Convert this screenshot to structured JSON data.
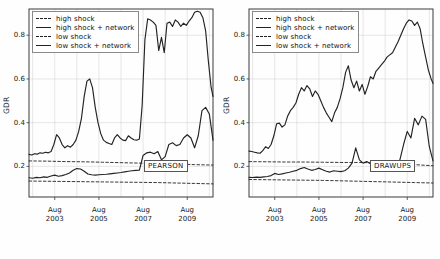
{
  "figure": {
    "panels": [
      "left",
      "right"
    ],
    "background": "#ffffff"
  },
  "legend": {
    "position": "upper-left",
    "entries": [
      {
        "label": "high shock",
        "style": "dashed",
        "color": "#222222"
      },
      {
        "label": "high shock + network",
        "style": "solid",
        "color": "#222222"
      },
      {
        "label": "low shock",
        "style": "dashed",
        "color": "#222222"
      },
      {
        "label": "low shock + network",
        "style": "solid",
        "color": "#222222"
      }
    ]
  },
  "chart_data": [
    {
      "type": "line",
      "panel": "left",
      "title": "",
      "annotation": "PEARSON",
      "xlabel": "",
      "ylabel": "GDR",
      "ylim": [
        0.06,
        0.92
      ],
      "yticks": [
        0.2,
        0.4,
        0.6,
        0.8
      ],
      "ytick_labels": [
        "0.2",
        "0.4",
        "0.6",
        "0.8"
      ],
      "xlim": [
        0,
        100
      ],
      "xticks": [
        14,
        38,
        62,
        86
      ],
      "xtick_labels": [
        [
          "Aug",
          "2003"
        ],
        [
          "Aug",
          "2005"
        ],
        [
          "Aug",
          "2007"
        ],
        [
          "Aug",
          "2009"
        ]
      ],
      "grid": true,
      "legend_position": "upper left",
      "series": [
        {
          "name": "high shock",
          "style": "dashed",
          "x": [
            0,
            10,
            20,
            30,
            40,
            50,
            60,
            70,
            80,
            90,
            100
          ],
          "values": [
            0.225,
            0.224,
            0.222,
            0.221,
            0.219,
            0.217,
            0.215,
            0.213,
            0.211,
            0.208,
            0.206
          ]
        },
        {
          "name": "low shock",
          "style": "dashed",
          "x": [
            0,
            10,
            20,
            30,
            40,
            50,
            60,
            70,
            80,
            90,
            100
          ],
          "values": [
            0.133,
            0.132,
            0.131,
            0.13,
            0.129,
            0.128,
            0.127,
            0.126,
            0.124,
            0.122,
            0.12
          ]
        },
        {
          "name": "high shock + network",
          "style": "solid",
          "x": [
            0,
            1.5,
            3,
            4.5,
            6,
            7.5,
            9,
            10.5,
            12,
            13.5,
            15,
            16.5,
            18,
            19.5,
            21,
            22.5,
            24,
            25.5,
            27,
            28.5,
            30,
            31.5,
            33,
            34.5,
            36,
            37.5,
            39,
            40.5,
            42,
            43.5,
            45,
            46.5,
            48,
            49.5,
            51,
            52.5,
            54,
            55.5,
            57,
            58.5,
            60,
            61.5,
            63,
            64.5,
            66,
            67.5,
            69,
            70.5,
            72,
            73.5,
            75,
            76.5,
            78,
            79.5,
            81,
            82.5,
            84,
            85.5,
            87,
            88.5,
            90,
            91.5,
            93,
            94.5,
            96,
            97.5,
            99,
            100
          ],
          "values": [
            0.255,
            0.252,
            0.258,
            0.256,
            0.262,
            0.26,
            0.265,
            0.262,
            0.268,
            0.3,
            0.345,
            0.33,
            0.3,
            0.285,
            0.295,
            0.288,
            0.3,
            0.32,
            0.36,
            0.42,
            0.52,
            0.59,
            0.6,
            0.56,
            0.47,
            0.4,
            0.35,
            0.32,
            0.31,
            0.305,
            0.3,
            0.33,
            0.345,
            0.33,
            0.32,
            0.318,
            0.34,
            0.33,
            0.322,
            0.32,
            0.325,
            0.48,
            0.78,
            0.875,
            0.87,
            0.86,
            0.845,
            0.73,
            0.79,
            0.72,
            0.855,
            0.86,
            0.84,
            0.87,
            0.86,
            0.84,
            0.855,
            0.845,
            0.865,
            0.88,
            0.905,
            0.91,
            0.905,
            0.88,
            0.82,
            0.68,
            0.56,
            0.52
          ]
        },
        {
          "name": "low shock + network",
          "style": "solid",
          "x": [
            0,
            2,
            4,
            6,
            8,
            10,
            12,
            14,
            16,
            18,
            20,
            22,
            24,
            26,
            28,
            30,
            32,
            34,
            36,
            38,
            40,
            42,
            44,
            46,
            48,
            50,
            52,
            54,
            56,
            58,
            60,
            62,
            64,
            66,
            68,
            70,
            72,
            74,
            76,
            78,
            80,
            82,
            84,
            86,
            88,
            90,
            92,
            94,
            96,
            98,
            100
          ],
          "values": [
            0.148,
            0.146,
            0.15,
            0.148,
            0.152,
            0.15,
            0.156,
            0.16,
            0.155,
            0.158,
            0.163,
            0.17,
            0.182,
            0.19,
            0.188,
            0.178,
            0.165,
            0.162,
            0.16,
            0.162,
            0.163,
            0.164,
            0.166,
            0.168,
            0.17,
            0.172,
            0.175,
            0.178,
            0.18,
            0.182,
            0.183,
            0.25,
            0.262,
            0.265,
            0.258,
            0.268,
            0.23,
            0.245,
            0.3,
            0.308,
            0.295,
            0.3,
            0.33,
            0.345,
            0.33,
            0.285,
            0.34,
            0.455,
            0.47,
            0.44,
            0.32
          ]
        }
      ]
    },
    {
      "type": "line",
      "panel": "right",
      "title": "",
      "annotation": "DRAWUPS",
      "xlabel": "",
      "ylabel": "GDR",
      "ylim": [
        0.06,
        0.92
      ],
      "yticks": [
        0.2,
        0.4,
        0.6,
        0.8
      ],
      "ytick_labels": [
        "0.2",
        "0.4",
        "0.6",
        "0.8"
      ],
      "xlim": [
        0,
        100
      ],
      "xticks": [
        14,
        38,
        62,
        86
      ],
      "xtick_labels": [
        [
          "Aug",
          "2003"
        ],
        [
          "Aug",
          "2005"
        ],
        [
          "Aug",
          "2007"
        ],
        [
          "Aug",
          "2009"
        ]
      ],
      "grid": true,
      "legend_position": "upper left",
      "series": [
        {
          "name": "high shock",
          "style": "dashed",
          "x": [
            0,
            10,
            20,
            30,
            40,
            50,
            60,
            70,
            80,
            90,
            100
          ],
          "values": [
            0.222,
            0.221,
            0.22,
            0.22,
            0.219,
            0.218,
            0.218,
            0.216,
            0.213,
            0.208,
            0.203
          ]
        },
        {
          "name": "low shock",
          "style": "dashed",
          "x": [
            0,
            10,
            20,
            30,
            40,
            50,
            60,
            70,
            80,
            90,
            100
          ],
          "values": [
            0.14,
            0.139,
            0.138,
            0.137,
            0.136,
            0.134,
            0.132,
            0.13,
            0.128,
            0.126,
            0.124
          ]
        },
        {
          "name": "high shock + network",
          "style": "solid",
          "x": [
            0,
            1.5,
            3,
            4.5,
            6,
            7.5,
            9,
            10.5,
            12,
            13.5,
            15,
            16.5,
            18,
            19.5,
            21,
            22.5,
            24,
            25.5,
            27,
            28.5,
            30,
            31.5,
            33,
            34.5,
            36,
            37.5,
            39,
            40.5,
            42,
            43.5,
            45,
            46.5,
            48,
            49.5,
            51,
            52.5,
            54,
            55.5,
            57,
            58.5,
            60,
            61.5,
            63,
            64.5,
            66,
            67.5,
            69,
            70.5,
            72,
            73.5,
            75,
            76.5,
            78,
            79.5,
            81,
            82.5,
            84,
            85.5,
            87,
            88.5,
            90,
            91.5,
            93,
            94.5,
            96,
            97.5,
            99,
            100
          ],
          "values": [
            0.27,
            0.268,
            0.265,
            0.262,
            0.26,
            0.272,
            0.29,
            0.282,
            0.3,
            0.34,
            0.395,
            0.398,
            0.38,
            0.39,
            0.43,
            0.455,
            0.47,
            0.49,
            0.53,
            0.56,
            0.545,
            0.57,
            0.555,
            0.52,
            0.545,
            0.53,
            0.5,
            0.47,
            0.445,
            0.425,
            0.405,
            0.445,
            0.47,
            0.51,
            0.56,
            0.63,
            0.66,
            0.595,
            0.56,
            0.59,
            0.545,
            0.575,
            0.53,
            0.565,
            0.61,
            0.6,
            0.635,
            0.65,
            0.665,
            0.68,
            0.7,
            0.71,
            0.72,
            0.745,
            0.77,
            0.8,
            0.83,
            0.855,
            0.87,
            0.865,
            0.845,
            0.86,
            0.83,
            0.76,
            0.7,
            0.64,
            0.6,
            0.58
          ]
        },
        {
          "name": "low shock + network",
          "style": "solid",
          "x": [
            0,
            2,
            4,
            6,
            8,
            10,
            12,
            14,
            16,
            18,
            20,
            22,
            24,
            26,
            28,
            30,
            32,
            34,
            36,
            38,
            40,
            42,
            44,
            46,
            48,
            50,
            52,
            54,
            56,
            58,
            60,
            62,
            64,
            66,
            68,
            70,
            72,
            74,
            76,
            78,
            80,
            82,
            84,
            86,
            88,
            90,
            92,
            94,
            96,
            98,
            100
          ],
          "values": [
            0.15,
            0.149,
            0.151,
            0.15,
            0.152,
            0.154,
            0.158,
            0.168,
            0.163,
            0.166,
            0.17,
            0.173,
            0.178,
            0.182,
            0.19,
            0.195,
            0.188,
            0.182,
            0.186,
            0.192,
            0.185,
            0.178,
            0.174,
            0.18,
            0.178,
            0.176,
            0.18,
            0.192,
            0.215,
            0.285,
            0.23,
            0.215,
            0.222,
            0.212,
            0.218,
            0.214,
            0.216,
            0.212,
            0.215,
            0.214,
            0.21,
            0.23,
            0.3,
            0.36,
            0.33,
            0.42,
            0.39,
            0.43,
            0.415,
            0.29,
            0.225
          ]
        }
      ]
    }
  ]
}
